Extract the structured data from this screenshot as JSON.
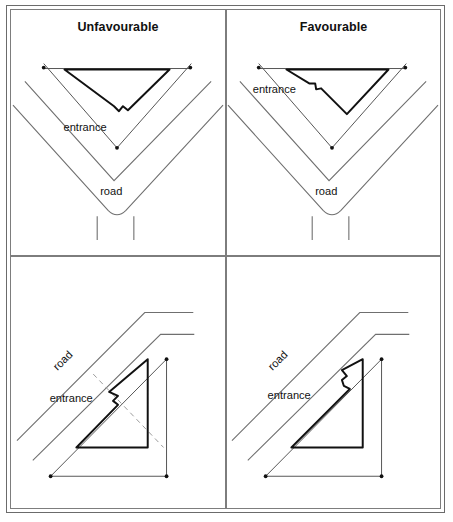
{
  "figure": {
    "type": "diagram",
    "panel_count": 4
  },
  "panels": {
    "top_left": {
      "title": "Unfavourable",
      "road_label": "road",
      "entrance_label": "entrance",
      "road_shape": "v-fork",
      "building_shape": "inverted-triangle",
      "entrance_position": "bottom-apex"
    },
    "top_right": {
      "title": "Favourable",
      "road_label": "road",
      "entrance_label": "entrance",
      "road_shape": "v-fork",
      "building_shape": "inverted-triangle",
      "entrance_position": "left-edge-facing-road"
    },
    "bottom_left": {
      "title": "",
      "road_label": "road",
      "entrance_label": "entrance",
      "road_shape": "diagonal-bend",
      "building_shape": "right-triangle",
      "entrance_position": "left-vertex",
      "has_dashed_sightline": true
    },
    "bottom_right": {
      "title": "",
      "road_label": "road",
      "entrance_label": "entrance",
      "road_shape": "diagonal-bend",
      "building_shape": "right-triangle",
      "entrance_position": "hypotenuse-top-facing-road",
      "has_dashed_sightline": false
    }
  },
  "colors": {
    "frame": "#6b6b6b",
    "panel_border": "#7d7d7d",
    "road_line": "#6f6f6f",
    "boundary_line": "#6f6f6f",
    "building_line": "#111111",
    "dashed_line": "#9a9a9a",
    "text": "#111111",
    "background": "#ffffff"
  }
}
